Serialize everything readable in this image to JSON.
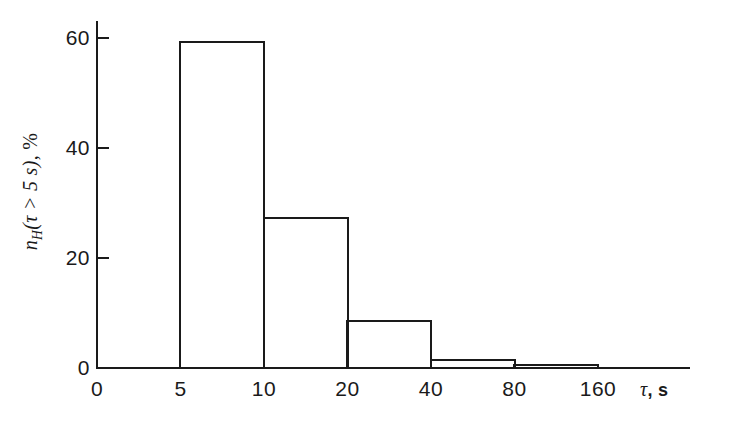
{
  "figure": {
    "width": 737,
    "height": 437,
    "background": "#ffffff",
    "ink_color": "#1a1a1a"
  },
  "chart_data": {
    "type": "bar",
    "title": "",
    "subtitle": "",
    "xlabel": "τ, s",
    "ylabel": "n_H(τ > 5 s), %",
    "ylabel_parts": {
      "symbol": "n",
      "subscript": "H",
      "argument": "(τ > 5 s)",
      "unit": "%"
    },
    "xlabel_parts": {
      "symbol": "τ",
      "unit": "s"
    },
    "categories": [
      "5–10",
      "10–20",
      "20–40",
      "40–80",
      "80–160"
    ],
    "bin_edges": [
      5,
      10,
      20,
      40,
      80,
      160
    ],
    "values": [
      59.5,
      27.5,
      8.7,
      1.7,
      0.8
    ],
    "xtick_labels": [
      "0",
      "5",
      "10",
      "20",
      "40",
      "80",
      "160"
    ],
    "xtick_values": [
      0,
      5,
      10,
      20,
      40,
      80,
      160
    ],
    "ytick_labels": [
      "0",
      "20",
      "40",
      "60"
    ],
    "ytick_values": [
      0,
      20,
      40,
      60
    ],
    "ylim": [
      0,
      63
    ],
    "xscale": "log-like-even-spacing",
    "grid": false,
    "legend": null,
    "bar_fill": "none",
    "bar_edge_color": "#1a1a1a"
  }
}
